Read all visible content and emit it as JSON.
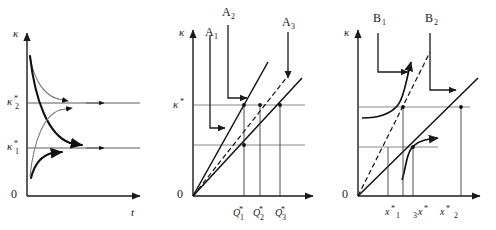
{
  "figure": {
    "panel_count": 3,
    "ink_color": "#111111",
    "guide_color": "#6a6a6a",
    "light_trajectory_color": "#777777"
  },
  "panel_a": {
    "name": "time-path-convergence",
    "y_axis_label": "κ",
    "x_axis_label": "t",
    "origin_label": "0",
    "levels": [
      {
        "label_base": "κ",
        "star": "*",
        "sub": "2",
        "role": "upper-steady-state"
      },
      {
        "label_base": "κ",
        "star": "*",
        "sub": "1",
        "role": "lower-steady-state"
      }
    ],
    "trajectories": [
      {
        "id": "a1",
        "style": "light",
        "direction": "decaying-to-upper"
      },
      {
        "id": "a2",
        "style": "bold",
        "direction": "decaying-to-lower"
      },
      {
        "id": "a3",
        "style": "light",
        "direction": "rising-to-upper"
      },
      {
        "id": "a4",
        "style": "bold",
        "direction": "rising-to-lower"
      }
    ]
  },
  "panel_b": {
    "name": "linear-rays-equilibria",
    "y_axis_label": "κ",
    "origin_label": "0",
    "y_level": {
      "base": "κ",
      "star": "*"
    },
    "top_labels": [
      {
        "base": "A",
        "sub": "1"
      },
      {
        "base": "A",
        "sub": "2"
      },
      {
        "base": "A",
        "sub": "3"
      }
    ],
    "x_labels": [
      {
        "base": "Q",
        "star": "*",
        "sub": "1"
      },
      {
        "base": "Q",
        "star": "*",
        "sub": "2"
      },
      {
        "base": "Q",
        "star": "*",
        "sub": "3"
      }
    ],
    "rays": [
      {
        "id": "steep",
        "style": "solid"
      },
      {
        "id": "middle",
        "style": "dashed"
      },
      {
        "id": "shallow",
        "style": "solid"
      }
    ]
  },
  "panel_c": {
    "name": "s-curve-equilibria",
    "y_axis_label": "κ",
    "origin_label": "0",
    "top_labels": [
      {
        "base": "B",
        "sub": "1"
      },
      {
        "base": "B",
        "sub": "2"
      }
    ],
    "x_labels": [
      {
        "base": "x",
        "star": "*",
        "sub": "1"
      },
      {
        "base": "x",
        "star": "*",
        "sub": "3"
      },
      {
        "base": "x",
        "star": "*",
        "sub": "2"
      }
    ],
    "lines": [
      {
        "id": "diagonal-dashed",
        "style": "dashed"
      },
      {
        "id": "diagonal-solid",
        "style": "solid"
      },
      {
        "id": "upper-s-curve",
        "style": "solid"
      },
      {
        "id": "lower-s-curve",
        "style": "solid"
      }
    ]
  }
}
